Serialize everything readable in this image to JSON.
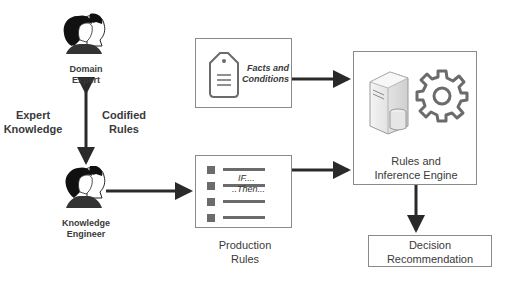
{
  "diagram": {
    "type": "expert-system-architecture",
    "nodes": {
      "domain_expert": {
        "label_line1": "Domain",
        "label_line2": "Expert",
        "icon": "people-icon"
      },
      "knowledge_engineer": {
        "label_line1": "Knowledge",
        "label_line2": "Engineer",
        "icon": "people-icon"
      },
      "facts": {
        "label_line1": "Facts and",
        "label_line2": "Conditions",
        "icon": "tag-icon"
      },
      "production_rules": {
        "label_line1": "Production",
        "label_line2": "Rules",
        "if_text": "IF....",
        "then_text": "..Then...",
        "icon": "list-icon"
      },
      "engine": {
        "label_line1": "Rules and",
        "label_line2": "Inference Engine",
        "icons": [
          "server-database-icon",
          "gear-icon"
        ]
      },
      "decision": {
        "label_line1": "Decision",
        "label_line2": "Recommendation"
      }
    },
    "edge_labels": {
      "left_line1": "Expert",
      "left_line2": "Knowledge",
      "right_line1": "Codified",
      "right_line2": "Rules"
    },
    "edges": [
      {
        "from": "domain_expert",
        "to": "knowledge_engineer",
        "bidirectional": true
      },
      {
        "from": "knowledge_engineer",
        "to": "production_rules"
      },
      {
        "from": "facts",
        "to": "engine"
      },
      {
        "from": "production_rules",
        "to": "engine"
      },
      {
        "from": "engine",
        "to": "decision"
      }
    ],
    "colors": {
      "arrow": "#2a2a2a",
      "border": "#8a8a8a",
      "icon_fill": "#6b6b6b",
      "text": "#3a3a3a"
    }
  }
}
